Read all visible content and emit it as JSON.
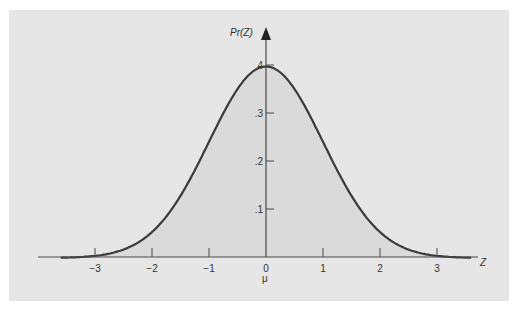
{
  "chart_data": {
    "type": "area",
    "xlabel": "Z",
    "ylabel": "Pr(Z)",
    "x_ticks": [
      "-3",
      "-2",
      "-1",
      "0",
      "1",
      "2",
      "3"
    ],
    "x_tick_values": [
      -3,
      -2,
      -1,
      0,
      1,
      2,
      3
    ],
    "y_ticks": [
      ".1",
      ".2",
      ".3",
      ".4"
    ],
    "y_tick_values": [
      0.1,
      0.2,
      0.3,
      0.4
    ],
    "annotations": [
      {
        "x": 0,
        "text": "μ"
      }
    ],
    "xlim": [
      -3.7,
      3.7
    ],
    "ylim": [
      0,
      0.42
    ],
    "grid": false,
    "series": [
      {
        "name": "Pr(Z)",
        "x": [
          -3.6,
          -3,
          -2.5,
          -2,
          -1.5,
          -1,
          -0.5,
          0,
          0.5,
          1,
          1.5,
          2,
          2.5,
          3,
          3.6
        ],
        "values": [
          0.001,
          0.004,
          0.018,
          0.054,
          0.13,
          0.242,
          0.352,
          0.399,
          0.352,
          0.242,
          0.13,
          0.054,
          0.018,
          0.004,
          0.001
        ]
      }
    ]
  },
  "labels": {
    "y_axis": "Pr(Z)",
    "x_axis": "Z",
    "mu": "μ",
    "x_ticks": [
      "−3",
      "−2",
      "−1",
      "0",
      "1",
      "2",
      "3"
    ],
    "y_ticks": [
      ".1",
      ".2",
      ".3",
      ".4"
    ]
  },
  "colors": {
    "panel": "#e6e6e6",
    "fill": "#dadada",
    "curve": "#3a3a3a",
    "axis": "#4a4a4a"
  }
}
